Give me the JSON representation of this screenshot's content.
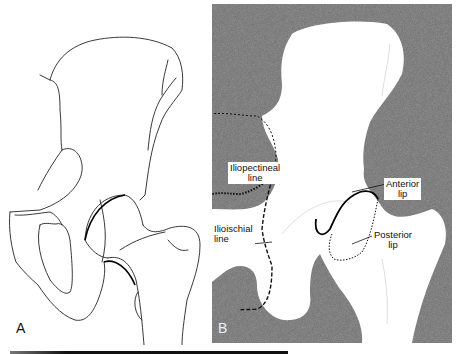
{
  "figure": {
    "panels": [
      {
        "id": "A",
        "letter": "A",
        "style": "line-drawing"
      },
      {
        "id": "B",
        "letter": "B",
        "style": "radiograph-schematic"
      }
    ],
    "labels": {
      "iliopectineal": {
        "line1": "Iliopectineal",
        "line2": "line"
      },
      "ilioischial": {
        "line1": "Ilioischial",
        "line2": "line"
      },
      "anterior_lip": {
        "line1": "Anterior",
        "line2": "lip"
      },
      "posterior_lip": {
        "line1": "Posterior",
        "line2": "lip"
      }
    },
    "colors": {
      "background": "#ffffff",
      "radiograph_gray": "#6e6e6e",
      "line": "#111111"
    }
  }
}
